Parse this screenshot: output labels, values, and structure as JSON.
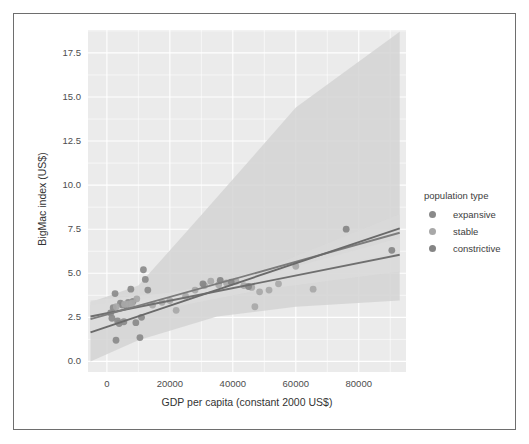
{
  "chart_data": {
    "type": "scatter",
    "title": "",
    "xlabel": "GDP per capita (constant 2000 US$)",
    "ylabel": "BigMac index (US$)",
    "xlim": [
      -6000,
      95000
    ],
    "ylim": [
      -0.6,
      18.8
    ],
    "xticks": [
      0,
      20000,
      40000,
      60000,
      80000
    ],
    "xtick_labels": [
      "0",
      "20000",
      "40000",
      "60000",
      "80000"
    ],
    "yticks": [
      0.0,
      2.5,
      5.0,
      7.5,
      10.0,
      12.5,
      15.0,
      17.5
    ],
    "ytick_labels": [
      "0.0",
      "2.5",
      "5.0",
      "7.5",
      "10.0",
      "12.5",
      "15.0",
      "17.5"
    ],
    "grid": true,
    "panel_background": "#ebebeb",
    "gridline_color": "#ffffff",
    "legend": {
      "title": "population type",
      "position": "right",
      "entries": [
        {
          "label": "expansive",
          "color": "#8a8a8a"
        },
        {
          "label": "stable",
          "color": "#a8a8a8"
        },
        {
          "label": "constrictive",
          "color": "#858585"
        }
      ]
    },
    "series": [
      {
        "name": "expansive",
        "color": "#8a8a8a",
        "points": [
          {
            "x": 1200,
            "y": 2.75
          },
          {
            "x": 1600,
            "y": 2.45
          },
          {
            "x": 2000,
            "y": 3.05
          },
          {
            "x": 2600,
            "y": 3.85
          },
          {
            "x": 2900,
            "y": 1.2
          },
          {
            "x": 3400,
            "y": 2.3
          },
          {
            "x": 3900,
            "y": 2.15
          },
          {
            "x": 4300,
            "y": 3.3
          },
          {
            "x": 4900,
            "y": 3.2
          },
          {
            "x": 5400,
            "y": 2.25
          },
          {
            "x": 6100,
            "y": 3.15
          },
          {
            "x": 6800,
            "y": 3.35
          },
          {
            "x": 7600,
            "y": 4.1
          },
          {
            "x": 8300,
            "y": 3.4
          },
          {
            "x": 9200,
            "y": 2.2
          },
          {
            "x": 10500,
            "y": 1.35
          },
          {
            "x": 11000,
            "y": 2.5
          },
          {
            "x": 11600,
            "y": 5.2
          },
          {
            "x": 12200,
            "y": 4.65
          },
          {
            "x": 13000,
            "y": 4.05
          }
        ]
      },
      {
        "name": "stable",
        "color": "#a8a8a8",
        "points": [
          {
            "x": 3000,
            "y": 3.1
          },
          {
            "x": 5600,
            "y": 3.25
          },
          {
            "x": 7000,
            "y": 3.25
          },
          {
            "x": 8000,
            "y": 3.3
          },
          {
            "x": 9500,
            "y": 3.55
          },
          {
            "x": 14500,
            "y": 3.2
          },
          {
            "x": 17500,
            "y": 3.35
          },
          {
            "x": 20000,
            "y": 3.45
          },
          {
            "x": 22000,
            "y": 2.9
          },
          {
            "x": 25000,
            "y": 3.7
          },
          {
            "x": 28000,
            "y": 4.05
          },
          {
            "x": 31000,
            "y": 4.3
          },
          {
            "x": 33000,
            "y": 4.55
          },
          {
            "x": 35500,
            "y": 4.35
          },
          {
            "x": 38000,
            "y": 4.45
          },
          {
            "x": 41000,
            "y": 4.55
          },
          {
            "x": 43500,
            "y": 4.3
          },
          {
            "x": 46000,
            "y": 4.2
          },
          {
            "x": 47000,
            "y": 3.1
          },
          {
            "x": 48500,
            "y": 3.95
          },
          {
            "x": 51500,
            "y": 4.05
          },
          {
            "x": 54500,
            "y": 4.4
          },
          {
            "x": 60000,
            "y": 5.4
          },
          {
            "x": 65500,
            "y": 4.1
          }
        ]
      },
      {
        "name": "constrictive",
        "color": "#858585",
        "points": [
          {
            "x": 30500,
            "y": 4.4
          },
          {
            "x": 36000,
            "y": 4.6
          },
          {
            "x": 39500,
            "y": 4.5
          },
          {
            "x": 45000,
            "y": 4.25
          },
          {
            "x": 76000,
            "y": 7.5
          },
          {
            "x": 90500,
            "y": 6.3
          }
        ]
      }
    ],
    "regression_lines": [
      {
        "name": "expansive",
        "color": "#6f6f6f",
        "x_start": -5200,
        "y_start": 2.55,
        "x_end": 93000,
        "y_end": 6.05,
        "band": "narrow"
      },
      {
        "name": "stable",
        "color": "#7c7c7c",
        "x_start": -5200,
        "y_start": 2.4,
        "x_end": 93000,
        "y_end": 7.3,
        "band": "narrow"
      },
      {
        "name": "constrictive",
        "color": "#6a6a6a",
        "x_start": -5200,
        "y_start": 1.65,
        "x_end": 93000,
        "y_end": 7.55,
        "band": "wide"
      }
    ],
    "confidence_bands": [
      {
        "name": "constrictive-ci",
        "fill": "#d4d4d4",
        "opacity": 0.85,
        "upper": [
          {
            "x": -5200,
            "y": 3.35
          },
          {
            "x": 10000,
            "y": 4.3
          },
          {
            "x": 30000,
            "y": 8.3
          },
          {
            "x": 60000,
            "y": 14.4
          },
          {
            "x": 93000,
            "y": 18.7
          }
        ],
        "lower": [
          {
            "x": -5200,
            "y": 0.0
          },
          {
            "x": 10000,
            "y": 1.2
          },
          {
            "x": 35000,
            "y": 2.55
          },
          {
            "x": 60000,
            "y": 3.1
          },
          {
            "x": 93000,
            "y": 3.45
          }
        ]
      },
      {
        "name": "stable-ci",
        "fill": "#d9d9d9",
        "opacity": 0.9,
        "upper": [
          {
            "x": -5200,
            "y": 3.2
          },
          {
            "x": 20000,
            "y": 3.75
          },
          {
            "x": 50000,
            "y": 5.25
          },
          {
            "x": 93000,
            "y": 8.35
          }
        ],
        "lower": [
          {
            "x": -5200,
            "y": 1.65
          },
          {
            "x": 20000,
            "y": 3.1
          },
          {
            "x": 50000,
            "y": 4.45
          },
          {
            "x": 93000,
            "y": 6.25
          }
        ]
      },
      {
        "name": "expansive-ci",
        "fill": "#dcdcdc",
        "opacity": 0.9,
        "upper": [
          {
            "x": -5200,
            "y": 3.45
          },
          {
            "x": 20000,
            "y": 3.9
          },
          {
            "x": 50000,
            "y": 4.9
          },
          {
            "x": 93000,
            "y": 7.0
          }
        ],
        "lower": [
          {
            "x": -5200,
            "y": 1.7
          },
          {
            "x": 20000,
            "y": 3.05
          },
          {
            "x": 50000,
            "y": 4.1
          },
          {
            "x": 93000,
            "y": 5.1
          }
        ]
      }
    ]
  }
}
